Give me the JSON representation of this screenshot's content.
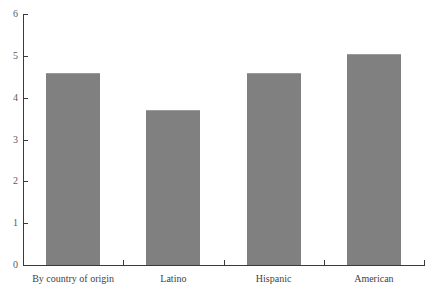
{
  "chart_data": {
    "type": "bar",
    "title": "",
    "xlabel": "",
    "ylabel": "",
    "categories": [
      "By country of origin",
      "Latino",
      "Hispanic",
      "American"
    ],
    "values": [
      4.6,
      3.7,
      4.6,
      5.05
    ],
    "ylim": [
      0,
      6
    ],
    "yticks": [
      0,
      1,
      2,
      3,
      4,
      5,
      6
    ],
    "ytick_labels": [
      "0",
      "1",
      "2",
      "3",
      "4",
      "5",
      "6"
    ],
    "grid": false,
    "legend": null,
    "series": [
      {
        "name": "",
        "values": [
          4.6,
          3.7,
          4.6,
          5.05
        ]
      }
    ],
    "colors": {
      "bar_fill": "#808080",
      "axis": "#3a3a3a",
      "tick_label": "#5a5a5a",
      "category_label": "#3f3f3f",
      "background": "#ffffff"
    }
  }
}
